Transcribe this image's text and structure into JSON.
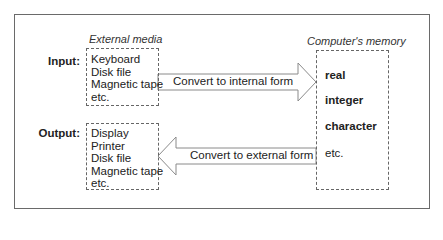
{
  "diagram": {
    "external_caption": "External media",
    "memory_caption": "Computer's memory",
    "input": {
      "label": "Input:",
      "items": [
        "Keyboard",
        "Disk file",
        "Magnetic tape",
        "etc."
      ]
    },
    "output": {
      "label": "Output:",
      "items": [
        "Display",
        "Printer",
        "Disk file",
        "Magnetic tape",
        "etc."
      ]
    },
    "memory": {
      "items": [
        {
          "text": "real",
          "bold": true
        },
        {
          "text": "integer",
          "bold": true
        },
        {
          "text": "character",
          "bold": true
        },
        {
          "text": "etc.",
          "bold": false
        }
      ]
    },
    "arrows": [
      {
        "label": "Convert to internal form",
        "direction": "right",
        "icon": "arrow-right-icon"
      },
      {
        "label": "Convert to external form",
        "direction": "left",
        "icon": "arrow-left-icon"
      }
    ],
    "colors": {
      "frame": "#6a6a6a",
      "arrow_stroke": "#8a8a8a",
      "dashed_border": "#666666"
    }
  }
}
